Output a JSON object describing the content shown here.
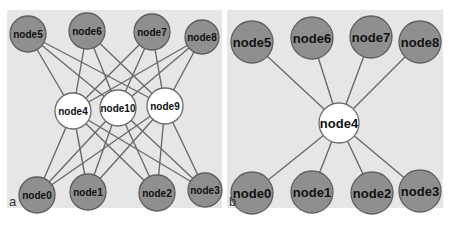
{
  "panels": [
    {
      "letter": "a",
      "nodes": [
        {
          "id": "node5",
          "x": 28,
          "y": 34,
          "r": 18,
          "type": "outer"
        },
        {
          "id": "node6",
          "x": 87,
          "y": 31,
          "r": 18,
          "type": "outer"
        },
        {
          "id": "node7",
          "x": 152,
          "y": 32,
          "r": 18,
          "type": "outer"
        },
        {
          "id": "node8",
          "x": 202,
          "y": 37,
          "r": 17,
          "type": "outer"
        },
        {
          "id": "node4",
          "x": 73,
          "y": 111,
          "r": 18,
          "type": "hub"
        },
        {
          "id": "node10",
          "x": 118,
          "y": 108,
          "r": 18,
          "type": "hub"
        },
        {
          "id": "node9",
          "x": 165,
          "y": 106,
          "r": 18,
          "type": "hub"
        },
        {
          "id": "node0",
          "x": 37,
          "y": 195,
          "r": 18,
          "type": "outer"
        },
        {
          "id": "node1",
          "x": 88,
          "y": 192,
          "r": 18,
          "type": "outer"
        },
        {
          "id": "node2",
          "x": 157,
          "y": 193,
          "r": 18,
          "type": "outer"
        },
        {
          "id": "node3",
          "x": 205,
          "y": 190,
          "r": 17,
          "type": "outer"
        }
      ],
      "edges": [
        [
          "node5",
          "node4"
        ],
        [
          "node5",
          "node10"
        ],
        [
          "node5",
          "node9"
        ],
        [
          "node6",
          "node4"
        ],
        [
          "node6",
          "node10"
        ],
        [
          "node6",
          "node9"
        ],
        [
          "node7",
          "node4"
        ],
        [
          "node7",
          "node10"
        ],
        [
          "node7",
          "node9"
        ],
        [
          "node8",
          "node4"
        ],
        [
          "node8",
          "node10"
        ],
        [
          "node8",
          "node9"
        ],
        [
          "node0",
          "node4"
        ],
        [
          "node0",
          "node10"
        ],
        [
          "node0",
          "node9"
        ],
        [
          "node1",
          "node4"
        ],
        [
          "node1",
          "node10"
        ],
        [
          "node1",
          "node9"
        ],
        [
          "node2",
          "node4"
        ],
        [
          "node2",
          "node10"
        ],
        [
          "node2",
          "node9"
        ],
        [
          "node3",
          "node4"
        ],
        [
          "node3",
          "node10"
        ],
        [
          "node3",
          "node9"
        ]
      ],
      "font_size": 10
    },
    {
      "letter": "b",
      "nodes": [
        {
          "id": "node5",
          "x": 252,
          "y": 42,
          "r": 21,
          "type": "outer"
        },
        {
          "id": "node6",
          "x": 312,
          "y": 38,
          "r": 21,
          "type": "outer"
        },
        {
          "id": "node7",
          "x": 371,
          "y": 37,
          "r": 21,
          "type": "outer"
        },
        {
          "id": "node8",
          "x": 420,
          "y": 42,
          "r": 21,
          "type": "outer"
        },
        {
          "id": "node4",
          "x": 339,
          "y": 123,
          "r": 20,
          "type": "hub"
        },
        {
          "id": "node0",
          "x": 252,
          "y": 193,
          "r": 21,
          "type": "outer"
        },
        {
          "id": "node1",
          "x": 312,
          "y": 192,
          "r": 21,
          "type": "outer"
        },
        {
          "id": "node2",
          "x": 372,
          "y": 193,
          "r": 21,
          "type": "outer"
        },
        {
          "id": "node3",
          "x": 420,
          "y": 191,
          "r": 21,
          "type": "outer"
        }
      ],
      "edges": [
        [
          "node5",
          "node4"
        ],
        [
          "node6",
          "node4"
        ],
        [
          "node7",
          "node4"
        ],
        [
          "node8",
          "node4"
        ],
        [
          "node0",
          "node4"
        ],
        [
          "node1",
          "node4"
        ],
        [
          "node2",
          "node4"
        ],
        [
          "node3",
          "node4"
        ]
      ],
      "font_size": 13
    }
  ],
  "colors": {
    "panel_bg": "#e6e6e6",
    "outer_node_fill": "#8f8f8f",
    "hub_node_fill": "#ffffff",
    "edge": "#6b6b6b"
  }
}
